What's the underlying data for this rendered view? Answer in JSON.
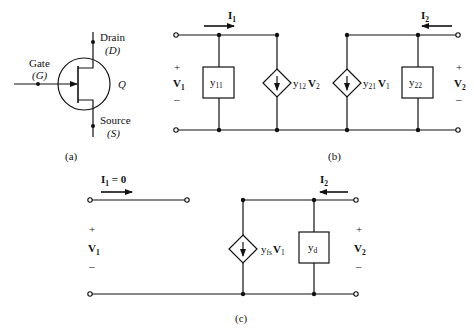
{
  "figure_a": {
    "caption": "(a)",
    "gate_label": "Gate",
    "gate_symbol": "(G)",
    "drain_label": "Drain",
    "drain_symbol": "(D)",
    "source_label": "Source",
    "source_symbol": "(S)",
    "device_label": "Q"
  },
  "figure_b": {
    "caption": "(b)",
    "i1": "I",
    "i1_sub": "1",
    "i2": "I",
    "i2_sub": "2",
    "v1": "V",
    "v1_sub": "1",
    "v2": "V",
    "v2_sub": "2",
    "plus": "+",
    "minus": "–",
    "y11": "y",
    "y11_sub": "11",
    "y12": "y",
    "y12_sub": "12",
    "y12_v": "V",
    "y12_v_sub": "2",
    "y21": "y",
    "y21_sub": "21",
    "y21_v": "V",
    "y21_v_sub": "1",
    "y22": "y",
    "y22_sub": "22"
  },
  "figure_c": {
    "caption": "(c)",
    "i1": "I",
    "i1_sub": "1",
    "i1_eq": " = 0",
    "i2": "I",
    "i2_sub": "2",
    "v1": "V",
    "v1_sub": "1",
    "v2": "V",
    "v2_sub": "2",
    "plus": "+",
    "minus": "–",
    "yfs": "y",
    "yfs_sub": "fs",
    "yfs_v": "V",
    "yfs_v_sub": "1",
    "yd": "y",
    "yd_sub": "d"
  }
}
